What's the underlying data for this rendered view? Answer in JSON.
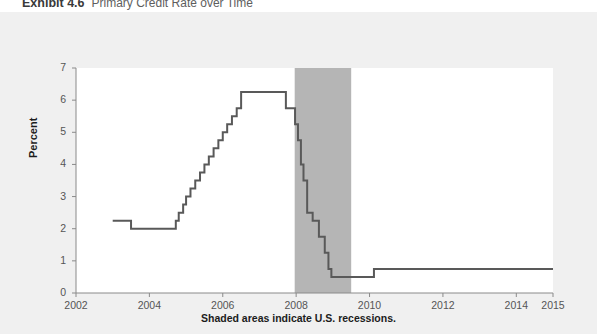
{
  "figure": {
    "exhibit_label": "Exhibit 4.6",
    "exhibit_title": "Primary Credit Rate over Time"
  },
  "colors": {
    "page_background": "#f1f1f1",
    "plot_background": "#ffffff",
    "recession_shading": "#b5b5b5",
    "line": "#595959",
    "axis": "#8a8a8a",
    "tick_text": "#555555",
    "label_text": "#1c1c1c"
  },
  "chart_data": {
    "type": "line",
    "title": "Primary Credit Rate over Time",
    "xlabel": "",
    "ylabel": "Percent",
    "xlim": [
      2002,
      2015
    ],
    "ylim": [
      0,
      7
    ],
    "grid": false,
    "legend": null,
    "step_style": "post",
    "yticks": [
      0,
      1,
      2,
      3,
      4,
      5,
      6,
      7
    ],
    "ytick_labels": [
      "0",
      "1",
      "2",
      "3",
      "4",
      "5",
      "6",
      "7"
    ],
    "xticks": [
      2002,
      2004,
      2006,
      2008,
      2010,
      2012,
      2014,
      2015
    ],
    "xtick_labels": [
      "2002",
      "2004",
      "2006",
      "2008",
      "2010",
      "2012",
      "2014",
      "2015"
    ],
    "annotation": "Shaded areas indicate U.S. recessions.",
    "shaded_regions": [
      {
        "label": "U.S. recession",
        "x_start": 2007.96,
        "x_end": 2009.5
      }
    ],
    "series": [
      {
        "name": "Primary Credit Rate",
        "x": [
          2003.0,
          2003.15,
          2003.5,
          2004.5,
          2004.72,
          2004.8,
          2004.92,
          2005.0,
          2005.12,
          2005.25,
          2005.38,
          2005.5,
          2005.62,
          2005.75,
          2005.88,
          2006.0,
          2006.12,
          2006.25,
          2006.38,
          2006.5,
          2007.6,
          2007.72,
          2007.97,
          2008.05,
          2008.13,
          2008.2,
          2008.3,
          2008.45,
          2008.62,
          2008.78,
          2008.88,
          2008.96,
          2010.12,
          2015.0
        ],
        "y": [
          2.25,
          2.25,
          2.0,
          2.0,
          2.25,
          2.5,
          2.75,
          3.0,
          3.25,
          3.5,
          3.75,
          4.0,
          4.25,
          4.5,
          4.75,
          5.0,
          5.25,
          5.5,
          5.75,
          6.25,
          6.25,
          5.75,
          5.25,
          4.75,
          4.0,
          3.5,
          2.5,
          2.25,
          1.75,
          1.25,
          0.75,
          0.5,
          0.75,
          0.75
        ]
      }
    ]
  }
}
